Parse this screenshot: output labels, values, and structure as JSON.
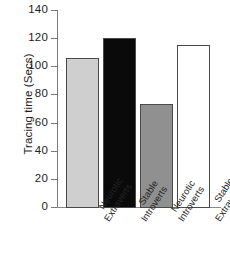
{
  "chart_data": {
    "type": "bar",
    "title": "",
    "subtitle": "",
    "xlabel": "",
    "ylabel": "Tracing time (Secs)",
    "ylim": [
      0,
      140
    ],
    "ytick_step": 20,
    "yticks": [
      "140",
      "120",
      "100",
      "80",
      "60",
      "40",
      "20",
      "0"
    ],
    "grid": false,
    "legend": "none",
    "categories": [
      "Neurotic Extraverts",
      "Stable Introverts",
      "Neurotic Introverts",
      "Stable Extraverts"
    ],
    "category_lines": [
      [
        "Neurotic",
        "Extraverts"
      ],
      [
        "Stable",
        "Introverts"
      ],
      [
        "Neurotic",
        "Introverts"
      ],
      [
        "Stable",
        "Extraverts"
      ]
    ],
    "values": [
      106,
      120,
      73,
      115
    ],
    "bar_colors": [
      "#cfcfcf",
      "#0a0a0a",
      "#909090",
      "#ffffff"
    ],
    "bar_edge_color": "#4a4a4a",
    "axis_color": "#7a7a7a",
    "text_color": "#1d1d1d"
  }
}
